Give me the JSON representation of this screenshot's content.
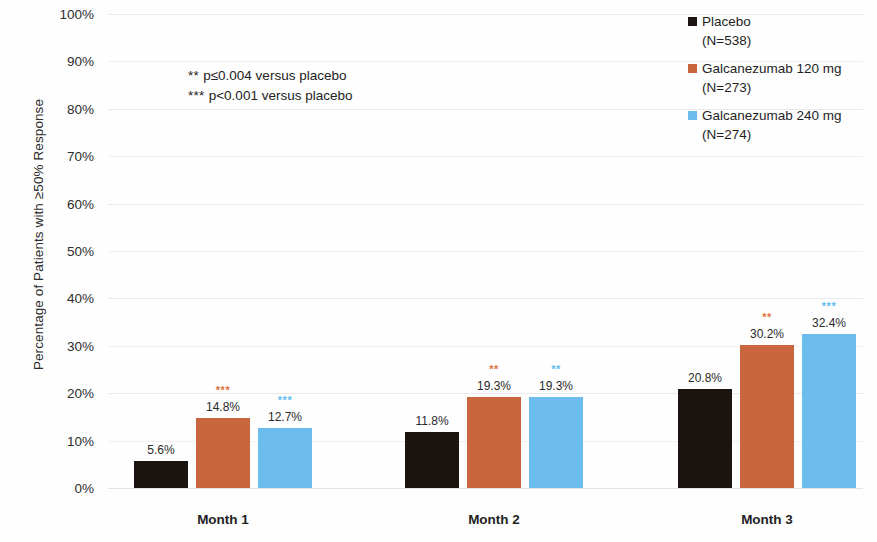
{
  "chart_data": {
    "type": "bar",
    "title": "",
    "xlabel": "",
    "ylabel": "Percentage of Patients with ≥50% Response",
    "ylim": [
      0,
      100
    ],
    "ytick_labels": [
      "100%",
      "90%",
      "80%",
      "70%",
      "60%",
      "50%",
      "40%",
      "30%",
      "20%",
      "10%",
      "0%"
    ],
    "ytick_values": [
      100,
      90,
      80,
      70,
      60,
      50,
      40,
      30,
      20,
      10,
      0
    ],
    "grid": true,
    "legend_position": "top-right",
    "categories": [
      "Month 1",
      "Month 2",
      "Month 3"
    ],
    "series": [
      {
        "name": "Placebo",
        "subtitle": "(N=538)",
        "color": "#1b1411",
        "values": [
          5.6,
          11.8,
          20.8
        ],
        "labels": [
          "5.6%",
          "11.8%",
          "20.8%"
        ],
        "significance": [
          "",
          "",
          ""
        ]
      },
      {
        "name": "Galcanezumab 120 mg",
        "subtitle": "(N=273)",
        "color": "#c9663e",
        "values": [
          14.8,
          19.3,
          30.2
        ],
        "labels": [
          "14.8%",
          "19.3%",
          "30.2%"
        ],
        "significance": [
          "***",
          "**",
          "**"
        ]
      },
      {
        "name": "Galcanezumab 240 mg",
        "subtitle": "(N=274)",
        "color": "#6cbdee",
        "values": [
          12.7,
          19.3,
          32.4
        ],
        "labels": [
          "12.7%",
          "19.3%",
          "32.4%"
        ],
        "significance": [
          "***",
          "**",
          "***"
        ]
      }
    ],
    "annotations": [
      {
        "stars": "**",
        "text": "p≤0.004 versus placebo"
      },
      {
        "stars": "***",
        "text": "p<0.001 versus placebo"
      }
    ]
  }
}
